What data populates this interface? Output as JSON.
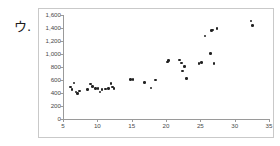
{
  "item_label": "ウ.",
  "chart_data": {
    "type": "scatter",
    "title": "",
    "subtitle": "",
    "xlabel": "",
    "ylabel": "",
    "xlim": [
      5,
      35
    ],
    "ylim": [
      0,
      1600
    ],
    "grid": false,
    "legend": false,
    "legend_position": "none",
    "marker": "filled-circle",
    "marker_color": "#222222",
    "x_ticks": [
      5,
      10,
      15,
      20,
      25,
      30,
      35
    ],
    "x_tick_labels": [
      "5",
      "10",
      "15",
      "20",
      "25",
      "30",
      "35"
    ],
    "y_ticks": [
      0,
      200,
      400,
      600,
      800,
      1000,
      1200,
      1400,
      1600
    ],
    "y_tick_labels": [
      "0",
      "200",
      "400",
      "600",
      "800",
      "1,000",
      "1,200",
      "1,400",
      "1,600"
    ],
    "points": [
      {
        "x": 6.1,
        "y": 490
      },
      {
        "x": 6.3,
        "y": 455
      },
      {
        "x": 6.6,
        "y": 555
      },
      {
        "x": 6.9,
        "y": 415
      },
      {
        "x": 7.1,
        "y": 395
      },
      {
        "x": 7.4,
        "y": 430
      },
      {
        "x": 8.6,
        "y": 455
      },
      {
        "x": 9.0,
        "y": 540
      },
      {
        "x": 9.3,
        "y": 500
      },
      {
        "x": 9.7,
        "y": 470
      },
      {
        "x": 10.1,
        "y": 470
      },
      {
        "x": 10.4,
        "y": 415
      },
      {
        "x": 10.7,
        "y": 450
      },
      {
        "x": 11.2,
        "y": 460
      },
      {
        "x": 11.6,
        "y": 470
      },
      {
        "x": 12.0,
        "y": 545
      },
      {
        "x": 12.2,
        "y": 490
      },
      {
        "x": 12.4,
        "y": 465
      },
      {
        "x": 14.8,
        "y": 610
      },
      {
        "x": 15.2,
        "y": 605
      },
      {
        "x": 16.9,
        "y": 565
      },
      {
        "x": 17.8,
        "y": 480
      },
      {
        "x": 18.5,
        "y": 600
      },
      {
        "x": 20.2,
        "y": 880
      },
      {
        "x": 20.4,
        "y": 900
      },
      {
        "x": 22.0,
        "y": 905
      },
      {
        "x": 22.3,
        "y": 860
      },
      {
        "x": 22.4,
        "y": 740
      },
      {
        "x": 22.7,
        "y": 810
      },
      {
        "x": 23.0,
        "y": 625
      },
      {
        "x": 24.8,
        "y": 855
      },
      {
        "x": 25.2,
        "y": 870
      },
      {
        "x": 25.7,
        "y": 1280
      },
      {
        "x": 26.5,
        "y": 1010
      },
      {
        "x": 26.6,
        "y": 1360
      },
      {
        "x": 26.8,
        "y": 1370
      },
      {
        "x": 27.0,
        "y": 850
      },
      {
        "x": 27.4,
        "y": 1390
      },
      {
        "x": 32.4,
        "y": 1505
      },
      {
        "x": 32.6,
        "y": 1435
      }
    ]
  }
}
